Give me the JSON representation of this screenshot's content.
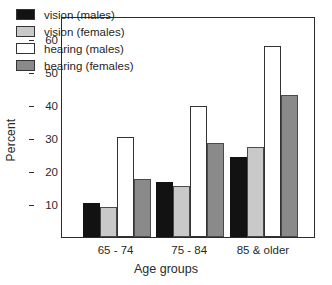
{
  "chart_data": {
    "type": "bar",
    "title": "",
    "xlabel": "Age  groups",
    "ylabel": "Percent",
    "categories": [
      "65 - 74",
      "75 - 84",
      "85 & older"
    ],
    "series": [
      {
        "name": "vision (males)",
        "color": "#121212",
        "values": [
          10.3,
          16.8,
          24.2
        ]
      },
      {
        "name": "vision (females)",
        "color": "#c9c9c9",
        "values": [
          9.1,
          15.4,
          27.3
        ]
      },
      {
        "name": "hearing (males)",
        "color": "#ffffff",
        "values": [
          30.3,
          39.7,
          57.8
        ]
      },
      {
        "name": "hearing (females)",
        "color": "#8a8a8a",
        "values": [
          17.5,
          28.4,
          43.2
        ]
      }
    ],
    "ylim": [
      0,
      67
    ],
    "yticks": [
      10,
      20,
      30,
      40,
      50,
      60
    ],
    "ytick_labels": [
      "10",
      "20",
      "30",
      "40",
      "50",
      "60"
    ],
    "grid": false,
    "legend_position": "upper-left"
  },
  "legend": {
    "entries": [
      {
        "label": "vision (males)"
      },
      {
        "label": "vision (females)"
      },
      {
        "label": "hearing (males)"
      },
      {
        "label": "hearing (females)"
      }
    ]
  },
  "axes": {
    "y_title": "Percent",
    "x_title": "Age  groups",
    "y_ticks": [
      "10",
      "20",
      "30",
      "40",
      "50",
      "60"
    ],
    "x_ticks": [
      "65 - 74",
      "75 - 84",
      "85 & older"
    ]
  }
}
